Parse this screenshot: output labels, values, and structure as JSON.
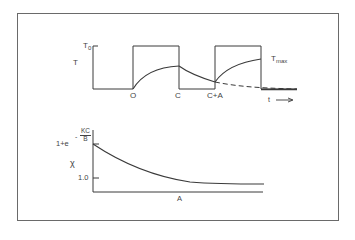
{
  "figure": {
    "top_panel": {
      "y_axis_label": "T",
      "y_tick_label_main": "T",
      "y_tick_label_sub": "0",
      "x_tick_labels": [
        "O",
        "C",
        "C+A"
      ],
      "curve_label_main": "T",
      "curve_label_sub": "max",
      "time_axis_label": "t",
      "time_arrow": "⟶"
    },
    "bottom_panel": {
      "y_axis_label": "χ",
      "y_tick_top_prefix": "1+e",
      "y_tick_top_exp_sign": "-",
      "y_tick_top_exp_num": "KC",
      "y_tick_top_exp_den": "B",
      "y_tick_bottom": "1.0",
      "x_axis_label": "A"
    },
    "colors": {
      "line": "#3a3a3a",
      "frame": "#6a6a6a",
      "background": "#ffffff"
    }
  }
}
